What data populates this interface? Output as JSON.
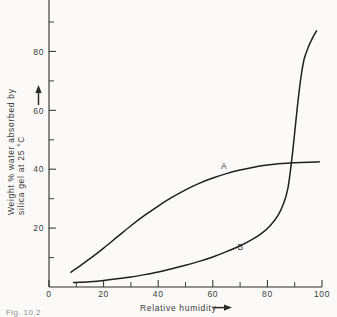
{
  "figure": {
    "caption_partial": "Fig. 10.2",
    "background_color": "#fbfaf8",
    "line_color": "#1f1f1f"
  },
  "chart_data": {
    "type": "line",
    "title": "",
    "xlabel": "Relative humidity",
    "ylabel_line1": "Weight % water absorbed by",
    "ylabel_line2": "silica gel at 25 °C",
    "xlim": [
      0,
      100
    ],
    "ylim": [
      0,
      92
    ],
    "grid": false,
    "legend_position": "inline-curve-labels",
    "x_ticks_major": [
      0,
      20,
      40,
      60,
      80,
      100
    ],
    "x_tick_labels": [
      "0",
      "20",
      "40",
      "60",
      "80",
      "100"
    ],
    "x_ticks_minor": [
      10,
      30,
      50,
      70,
      90
    ],
    "y_ticks_major": [
      20,
      40,
      60,
      80
    ],
    "y_tick_labels": [
      "20",
      "40",
      "60",
      "80"
    ],
    "y_ticks_minor": [
      10,
      30,
      50,
      70,
      90
    ],
    "x_axis_arrow": true,
    "y_axis_arrow": true,
    "series": [
      {
        "name": "A",
        "label": "A",
        "label_x": 63,
        "label_y": 39,
        "description": "Type I isotherm, plateau near 42.5 wt%",
        "points": [
          [
            8,
            5.0
          ],
          [
            12,
            7.6
          ],
          [
            16,
            10.3
          ],
          [
            20,
            13.2
          ],
          [
            25,
            17.0
          ],
          [
            30,
            20.8
          ],
          [
            35,
            24.3
          ],
          [
            40,
            27.5
          ],
          [
            45,
            30.4
          ],
          [
            50,
            33.0
          ],
          [
            55,
            35.2
          ],
          [
            60,
            37.0
          ],
          [
            65,
            38.5
          ],
          [
            70,
            39.7
          ],
          [
            75,
            40.7
          ],
          [
            80,
            41.4
          ],
          [
            85,
            41.9
          ],
          [
            90,
            42.2
          ],
          [
            95,
            42.4
          ],
          [
            99,
            42.5
          ]
        ]
      },
      {
        "name": "B",
        "label": "B",
        "label_x": 69,
        "label_y": 11.5,
        "description": "Type V isotherm, near-flat then steep rise above 88% RH",
        "points": [
          [
            9,
            1.5
          ],
          [
            15,
            1.8
          ],
          [
            20,
            2.2
          ],
          [
            25,
            2.8
          ],
          [
            30,
            3.4
          ],
          [
            35,
            4.2
          ],
          [
            40,
            5.1
          ],
          [
            45,
            6.2
          ],
          [
            50,
            7.4
          ],
          [
            55,
            8.7
          ],
          [
            60,
            10.2
          ],
          [
            65,
            12.0
          ],
          [
            70,
            14.0
          ],
          [
            74,
            15.9
          ],
          [
            78,
            18.3
          ],
          [
            81,
            20.8
          ],
          [
            84,
            24.5
          ],
          [
            86,
            28.5
          ],
          [
            87.5,
            33.5
          ],
          [
            88.5,
            40.0
          ],
          [
            89.5,
            48.0
          ],
          [
            90.5,
            57.0
          ],
          [
            91.5,
            65.5
          ],
          [
            92.5,
            72.5
          ],
          [
            93.5,
            77.5
          ],
          [
            95,
            81.5
          ],
          [
            96.5,
            84.5
          ],
          [
            98,
            87.0
          ]
        ]
      }
    ]
  }
}
